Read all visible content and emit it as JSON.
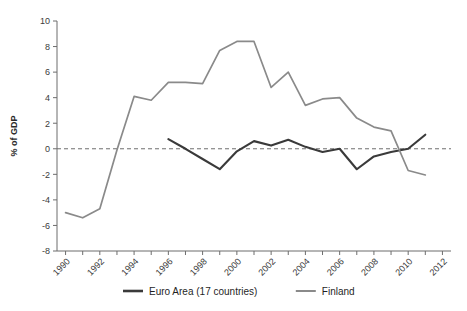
{
  "chart_data": {
    "type": "line",
    "title": "",
    "xlabel": "",
    "ylabel": "% of GDP",
    "ylim": [
      -8,
      10
    ],
    "xlim": [
      1989.5,
      2012.5
    ],
    "ytick_labels": [
      "10",
      "8",
      "6",
      "4",
      "2",
      "0",
      "-2",
      "-4",
      "-6",
      "-8"
    ],
    "ytick_values": [
      10,
      8,
      6,
      4,
      2,
      0,
      -2,
      -4,
      -6,
      -8
    ],
    "xtick_labels": [
      "1990",
      "1992",
      "1994",
      "1996",
      "1998",
      "2000",
      "2002",
      "2004",
      "2006",
      "2008",
      "2010",
      "2012"
    ],
    "xtick_values": [
      1990,
      1992,
      1994,
      1996,
      1998,
      2000,
      2002,
      2004,
      2006,
      2008,
      2010,
      2012
    ],
    "minor_xticks": [
      1991,
      1993,
      1995,
      1997,
      1999,
      2001,
      2003,
      2005,
      2007,
      2009,
      2011
    ],
    "grid": false,
    "zero_reference_line": true,
    "legend_position": "bottom",
    "series": [
      {
        "name": "Euro Area (17 countries)",
        "color": "#3a3a3a",
        "x": [
          1996,
          1997,
          1998,
          1999,
          2000,
          2001,
          2002,
          2003,
          2004,
          2005,
          2006,
          2007,
          2008,
          2009,
          2010,
          2011
        ],
        "values": [
          0.75,
          0.0,
          -0.8,
          -1.6,
          -0.2,
          0.6,
          0.25,
          0.7,
          0.15,
          -0.25,
          0.0,
          -1.6,
          -0.6,
          -0.25,
          0.0,
          1.1
        ]
      },
      {
        "name": "Finland",
        "color": "#8a8a8a",
        "x": [
          1990,
          1991,
          1992,
          1993,
          1994,
          1995,
          1996,
          1997,
          1998,
          1999,
          2000,
          2001,
          2002,
          2003,
          2004,
          2005,
          2006,
          2007,
          2008,
          2009,
          2010,
          2011
        ],
        "values": [
          -5.0,
          -5.4,
          -4.7,
          -0.1,
          4.1,
          3.8,
          5.2,
          5.2,
          5.1,
          7.7,
          8.4,
          8.4,
          4.8,
          6.0,
          3.4,
          3.9,
          4.0,
          2.4,
          1.7,
          1.4,
          -1.7,
          -2.05
        ]
      }
    ]
  },
  "axis": {
    "y_title": "% of GDP"
  },
  "legend": {
    "items": [
      {
        "label": "Euro Area (17 countries)",
        "color": "#3a3a3a",
        "width": 2.6
      },
      {
        "label": "Finland",
        "color": "#8a8a8a",
        "width": 2.0
      }
    ]
  }
}
